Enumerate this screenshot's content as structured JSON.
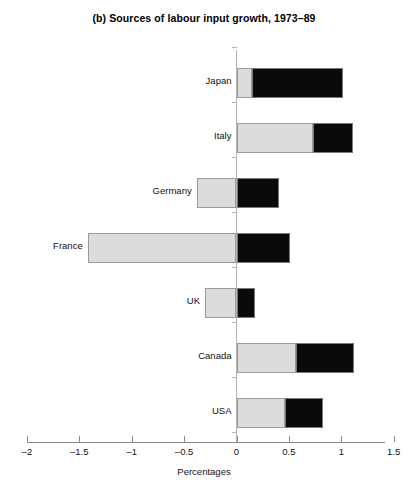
{
  "chart_data": {
    "type": "bar",
    "orientation": "horizontal",
    "stacked": true,
    "title": "(b) Sources of labour input growth, 1973–89",
    "xlabel": "Percentages",
    "ylabel": "",
    "xlim": [
      -2,
      1.5
    ],
    "xticks": [
      -2,
      -1.5,
      -1,
      -0.5,
      0,
      0.5,
      1,
      1.5
    ],
    "xtick_labels": [
      "–2",
      "–1.5",
      "–1",
      "–0.5",
      "0",
      "0.5",
      "1",
      "1.5"
    ],
    "grid": false,
    "legend": "none",
    "categories": [
      "Japan",
      "Italy",
      "Germany",
      "France",
      "UK",
      "Canada",
      "USA"
    ],
    "series": [
      {
        "name": "hours",
        "color": "#dcdcdc",
        "values": [
          0.15,
          0.73,
          -0.38,
          -1.42,
          -0.3,
          0.57,
          0.46
        ]
      },
      {
        "name": "employment",
        "color": "#0a0a0a",
        "values": [
          0.87,
          0.38,
          0.79,
          1.93,
          0.48,
          0.55,
          0.37
        ]
      }
    ],
    "totals": [
      1.02,
      1.11,
      0.41,
      0.51,
      0.18,
      1.12,
      0.83
    ]
  },
  "colors": {
    "gray_fill": "#dcdcdc",
    "gray_border": "#9a9a9a",
    "black_fill": "#0a0a0a",
    "axis": "#8c8c8c",
    "text": "#111111",
    "background": "#ffffff"
  }
}
